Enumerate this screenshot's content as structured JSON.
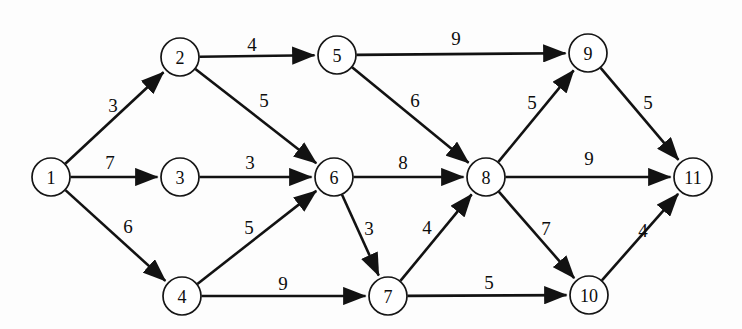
{
  "figure": {
    "type": "directed-weighted-graph",
    "background_color": "#fdfdfd",
    "stroke_color": "#121212",
    "node_fill": "#ffffff",
    "width": 742,
    "height": 329
  },
  "chart_data": {
    "type": "diagram",
    "title": "",
    "graph_type": "directed acyclic weighted graph (network / shortest-path style)",
    "node_radius": 19,
    "nodes": [
      {
        "id": "1",
        "label": "1",
        "x": 51,
        "y": 177
      },
      {
        "id": "2",
        "label": "2",
        "x": 180,
        "y": 57
      },
      {
        "id": "3",
        "label": "3",
        "x": 180,
        "y": 177
      },
      {
        "id": "4",
        "label": "4",
        "x": 182,
        "y": 296
      },
      {
        "id": "5",
        "label": "5",
        "x": 337,
        "y": 55
      },
      {
        "id": "6",
        "label": "6",
        "x": 334,
        "y": 177
      },
      {
        "id": "7",
        "label": "7",
        "x": 388,
        "y": 296
      },
      {
        "id": "8",
        "label": "8",
        "x": 486,
        "y": 177
      },
      {
        "id": "9",
        "label": "9",
        "x": 588,
        "y": 53
      },
      {
        "id": "10",
        "label": "10",
        "x": 589,
        "y": 295
      },
      {
        "id": "11",
        "label": "11",
        "x": 693,
        "y": 177
      }
    ],
    "edges": [
      {
        "from": "1",
        "to": "2",
        "weight": 3,
        "label": "3",
        "label_x": 113,
        "label_y": 105
      },
      {
        "from": "1",
        "to": "3",
        "weight": 7,
        "label": "7",
        "label_x": 110,
        "label_y": 162
      },
      {
        "from": "1",
        "to": "4",
        "weight": 6,
        "label": "6",
        "label_x": 128,
        "label_y": 226
      },
      {
        "from": "2",
        "to": "5",
        "weight": 4,
        "label": "4",
        "label_x": 252,
        "label_y": 44
      },
      {
        "from": "2",
        "to": "6",
        "weight": 5,
        "label": "5",
        "label_x": 264,
        "label_y": 100
      },
      {
        "from": "3",
        "to": "6",
        "weight": 3,
        "label": "3",
        "label_x": 250,
        "label_y": 162
      },
      {
        "from": "4",
        "to": "6",
        "weight": 5,
        "label": "5",
        "label_x": 249,
        "label_y": 227
      },
      {
        "from": "4",
        "to": "7",
        "weight": 9,
        "label": "9",
        "label_x": 283,
        "label_y": 283
      },
      {
        "from": "5",
        "to": "9",
        "weight": 9,
        "label": "9",
        "label_x": 456,
        "label_y": 38
      },
      {
        "from": "5",
        "to": "8",
        "weight": 6,
        "label": "6",
        "label_x": 415,
        "label_y": 100
      },
      {
        "from": "6",
        "to": "8",
        "weight": 8,
        "label": "8",
        "label_x": 403,
        "label_y": 162
      },
      {
        "from": "6",
        "to": "7",
        "weight": 3,
        "label": "3",
        "label_x": 369,
        "label_y": 228
      },
      {
        "from": "7",
        "to": "8",
        "weight": 4,
        "label": "4",
        "label_x": 427,
        "label_y": 227
      },
      {
        "from": "7",
        "to": "10",
        "weight": 5,
        "label": "5",
        "label_x": 489,
        "label_y": 282
      },
      {
        "from": "8",
        "to": "9",
        "weight": 5,
        "label": "5",
        "label_x": 532,
        "label_y": 102
      },
      {
        "from": "8",
        "to": "11",
        "weight": 9,
        "label": "9",
        "label_x": 589,
        "label_y": 158
      },
      {
        "from": "8",
        "to": "10",
        "weight": 7,
        "label": "7",
        "label_x": 546,
        "label_y": 228
      },
      {
        "from": "9",
        "to": "11",
        "weight": 5,
        "label": "5",
        "label_x": 648,
        "label_y": 102
      },
      {
        "from": "10",
        "to": "11",
        "weight": 4,
        "label": "4",
        "label_x": 643,
        "label_y": 230
      }
    ]
  }
}
